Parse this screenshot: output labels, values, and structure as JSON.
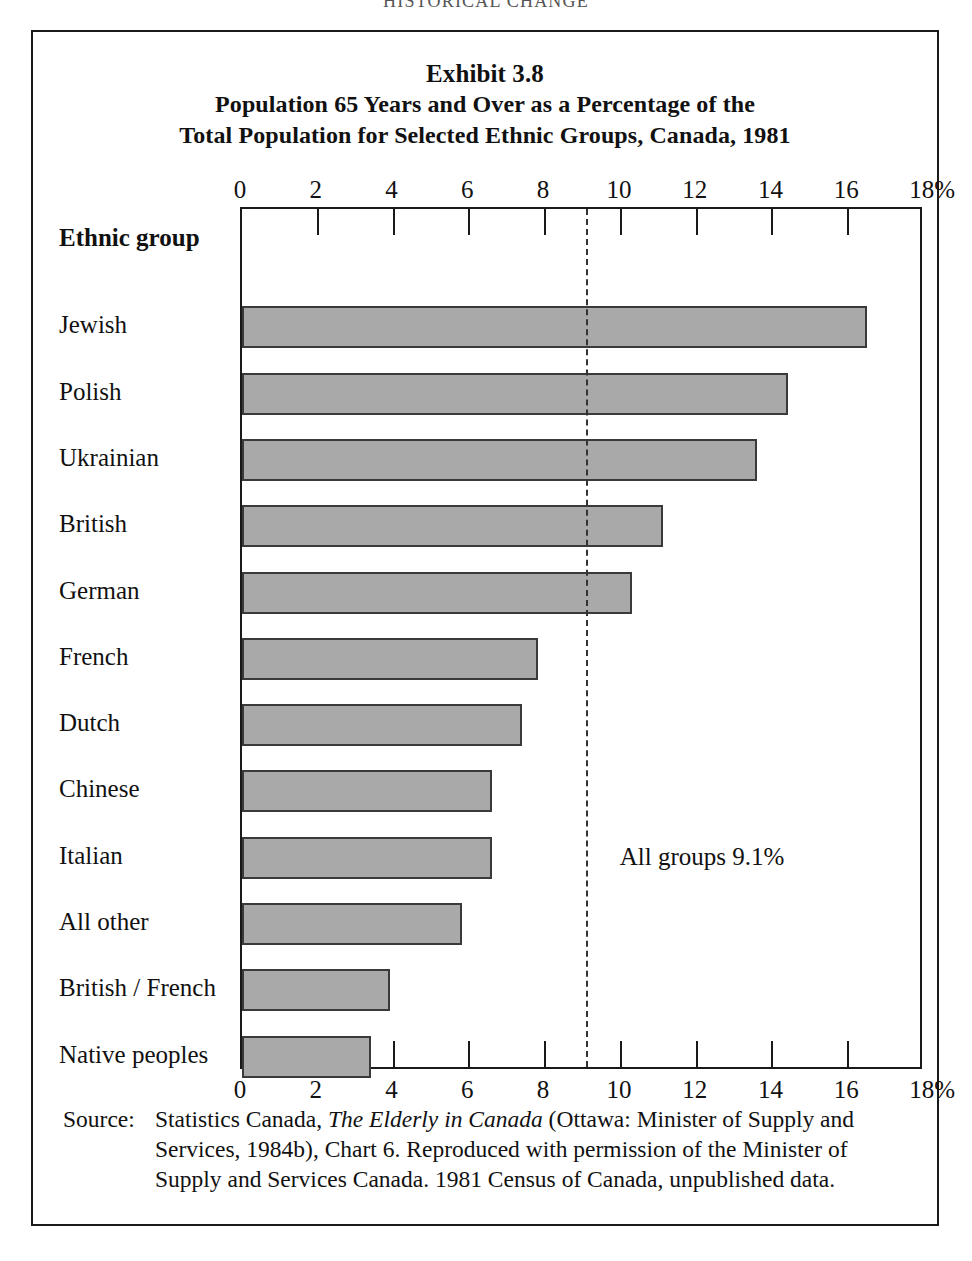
{
  "running_head": "HISTORICAL CHANGE",
  "figure": {
    "exhibit_label": "Exhibit 3.8",
    "title_line_2": "Population 65 Years and Over as a Percentage of the",
    "title_line_3": "Total Population for Selected Ethnic Groups, Canada, 1981",
    "row_header": "Ethnic group",
    "annotation": "All groups 9.1%",
    "source_label": "Source:",
    "source_text_1": "Statistics Canada, ",
    "source_italic": "The Elderly in Canada",
    "source_text_2": " (Ottawa: Minister of Supply and Services, 1984b), Chart 6. Reproduced with permission of the Minister of Supply and Services Canada. 1981 Census of Canada, unpublished data."
  },
  "colors": {
    "bar_fill": "#a9a9a9",
    "bar_stroke": "#3a3a3a",
    "frame": "#1a1a1a",
    "mean_line": "#333333"
  },
  "chart_data": {
    "type": "bar",
    "orientation": "horizontal",
    "title": "Population 65 Years and Over as a Percentage of the Total Population for Selected Ethnic Groups, Canada, 1981",
    "subtitle": "Exhibit 3.8",
    "xlabel": "",
    "ylabel": "Ethnic group",
    "xlim": [
      0,
      18
    ],
    "x_tick_labels": [
      "0",
      "2",
      "4",
      "6",
      "8",
      "10",
      "12",
      "14",
      "16",
      "18%"
    ],
    "x_tick_values": [
      0,
      2,
      4,
      6,
      8,
      10,
      12,
      14,
      16,
      18
    ],
    "grid": false,
    "legend": "none",
    "axis_duplicated_top_and_bottom": true,
    "categories": [
      "Jewish",
      "Polish",
      "Ukrainian",
      "British",
      "German",
      "French",
      "Dutch",
      "Chinese",
      "Italian",
      "All other",
      "British / French",
      "Native peoples"
    ],
    "values": [
      16.5,
      14.4,
      13.6,
      11.1,
      10.3,
      7.8,
      7.4,
      6.6,
      6.6,
      5.8,
      3.9,
      3.4
    ],
    "annotations": [
      {
        "text": "All groups 9.1%",
        "type": "reference-line",
        "value": 9.1,
        "style": "dashed-vertical"
      }
    ]
  }
}
